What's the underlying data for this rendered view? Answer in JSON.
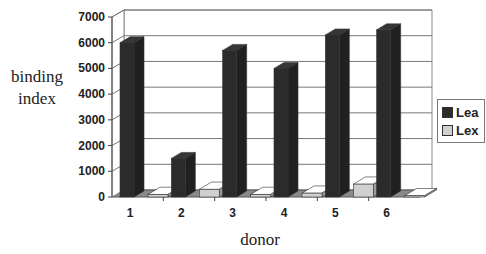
{
  "chart_data": {
    "type": "bar",
    "style": "3d-clustered-column",
    "title": "",
    "xlabel": "donor",
    "ylabel": "binding index",
    "ylabel_lines": [
      "binding",
      "index"
    ],
    "categories": [
      "1",
      "2",
      "3",
      "4",
      "5",
      "6"
    ],
    "series": [
      {
        "name": "Lea",
        "color": "#2b2b2b",
        "values": [
          6000,
          1500,
          5700,
          5000,
          6300,
          6500
        ]
      },
      {
        "name": "Lex",
        "color": "#d0d0d0",
        "values": [
          100,
          300,
          100,
          150,
          500,
          50
        ]
      }
    ],
    "ylim": [
      0,
      7000
    ],
    "yticks": [
      "0",
      "1000",
      "2000",
      "3000",
      "4000",
      "5000",
      "6000",
      "7000"
    ],
    "grid": true,
    "legend_position": "right"
  }
}
